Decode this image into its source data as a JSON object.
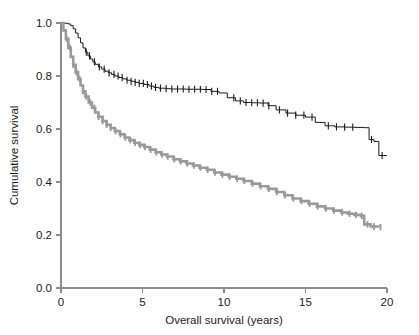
{
  "chart_data": {
    "type": "line",
    "title": "",
    "subtitle": "",
    "xlabel": "Overall survival (years)",
    "ylabel": "Cumulative survival",
    "xlim": [
      0,
      20
    ],
    "ylim": [
      0.0,
      1.0
    ],
    "xticks": [
      0,
      5,
      10,
      15,
      20
    ],
    "xticklabels": [
      "0",
      "5",
      "10",
      "15",
      "20"
    ],
    "yticks": [
      0.0,
      0.2,
      0.4,
      0.6,
      0.8,
      1.0
    ],
    "yticklabels": [
      "0.0",
      "0.2",
      "0.4",
      "0.6",
      "0.8",
      "1.0"
    ],
    "grid": false,
    "legend": "none",
    "plot_style": "kaplan-meier step function with censoring tick marks",
    "series": [
      {
        "name": "upper-curve",
        "color": "#1a1a1a",
        "linewidth": 1.0,
        "censor_marker": "vertical tick",
        "x": [
          0.0,
          0.25,
          0.45,
          0.6,
          0.75,
          0.9,
          1.05,
          1.2,
          1.35,
          1.5,
          1.65,
          1.8,
          1.95,
          2.1,
          2.3,
          2.5,
          2.7,
          2.9,
          3.1,
          3.3,
          3.55,
          3.8,
          4.05,
          4.3,
          4.55,
          4.8,
          5.1,
          5.4,
          5.7,
          6.0,
          6.4,
          6.8,
          7.2,
          7.7,
          8.2,
          8.7,
          9.2,
          9.7,
          10.2,
          10.7,
          11.2,
          11.7,
          12.2,
          12.7,
          13.2,
          13.8,
          14.4,
          15.0,
          15.6,
          16.2,
          16.8,
          17.4,
          18.0,
          18.6,
          18.9,
          19.2,
          19.5,
          20.0
        ],
        "y": [
          1.0,
          0.999,
          0.996,
          0.99,
          0.978,
          0.962,
          0.944,
          0.925,
          0.906,
          0.89,
          0.876,
          0.864,
          0.853,
          0.844,
          0.834,
          0.826,
          0.818,
          0.812,
          0.806,
          0.8,
          0.794,
          0.789,
          0.784,
          0.78,
          0.776,
          0.772,
          0.768,
          0.762,
          0.757,
          0.754,
          0.752,
          0.751,
          0.751,
          0.75,
          0.75,
          0.749,
          0.742,
          0.736,
          0.718,
          0.706,
          0.7,
          0.699,
          0.698,
          0.688,
          0.672,
          0.66,
          0.652,
          0.645,
          0.625,
          0.612,
          0.608,
          0.607,
          0.606,
          0.605,
          0.56,
          0.553,
          0.5,
          0.5
        ],
        "censor_x": [
          1.55,
          1.75,
          2.05,
          2.35,
          2.65,
          2.95,
          3.25,
          3.5,
          3.75,
          4.05,
          4.3,
          4.55,
          4.8,
          5.05,
          5.3,
          5.55,
          5.8,
          6.1,
          6.45,
          6.8,
          7.15,
          7.5,
          7.85,
          8.2,
          8.55,
          8.9,
          9.25,
          9.6,
          10.6,
          11.0,
          11.35,
          11.7,
          12.05,
          12.4,
          12.75,
          13.4,
          13.9,
          14.4,
          14.9,
          15.4,
          16.4,
          16.9,
          17.4,
          17.9,
          19.05,
          19.7
        ]
      },
      {
        "name": "lower-curve",
        "color": "#9a9a9a",
        "linewidth": 2.6,
        "censor_marker": "vertical tick",
        "x": [
          0.0,
          0.15,
          0.3,
          0.45,
          0.6,
          0.75,
          0.9,
          1.05,
          1.2,
          1.35,
          1.5,
          1.7,
          1.9,
          2.1,
          2.3,
          2.55,
          2.8,
          3.05,
          3.3,
          3.6,
          3.9,
          4.2,
          4.5,
          4.8,
          5.1,
          5.45,
          5.8,
          6.15,
          6.5,
          6.9,
          7.3,
          7.7,
          8.1,
          8.5,
          8.95,
          9.4,
          9.85,
          10.3,
          10.75,
          11.2,
          11.7,
          12.2,
          12.7,
          13.2,
          13.7,
          14.2,
          14.7,
          15.2,
          15.7,
          16.2,
          16.7,
          17.2,
          17.6,
          18.0,
          18.4,
          18.6,
          19.0,
          19.5
        ],
        "y": [
          1.0,
          0.972,
          0.94,
          0.906,
          0.872,
          0.842,
          0.814,
          0.788,
          0.764,
          0.742,
          0.722,
          0.7,
          0.68,
          0.662,
          0.646,
          0.63,
          0.616,
          0.604,
          0.592,
          0.58,
          0.568,
          0.558,
          0.548,
          0.54,
          0.532,
          0.522,
          0.512,
          0.504,
          0.496,
          0.486,
          0.478,
          0.47,
          0.462,
          0.454,
          0.446,
          0.436,
          0.428,
          0.42,
          0.412,
          0.404,
          0.394,
          0.384,
          0.374,
          0.362,
          0.35,
          0.338,
          0.328,
          0.318,
          0.308,
          0.3,
          0.292,
          0.285,
          0.28,
          0.276,
          0.272,
          0.24,
          0.232,
          0.23
        ],
        "censor_x": [
          0.35,
          0.55,
          0.75,
          0.95,
          1.15,
          1.35,
          1.55,
          1.8,
          2.05,
          2.3,
          2.55,
          2.8,
          3.05,
          3.35,
          3.65,
          3.95,
          4.25,
          4.55,
          4.85,
          5.15,
          5.5,
          5.85,
          6.2,
          6.55,
          6.95,
          7.35,
          7.75,
          8.15,
          8.55,
          9.0,
          9.45,
          9.9,
          10.35,
          10.8,
          11.25,
          11.75,
          12.25,
          12.75,
          13.25,
          13.75,
          14.25,
          14.75,
          15.25,
          15.75,
          16.25,
          16.75,
          17.25,
          17.7,
          18.1,
          18.45,
          18.8,
          19.2,
          19.6
        ]
      }
    ]
  }
}
